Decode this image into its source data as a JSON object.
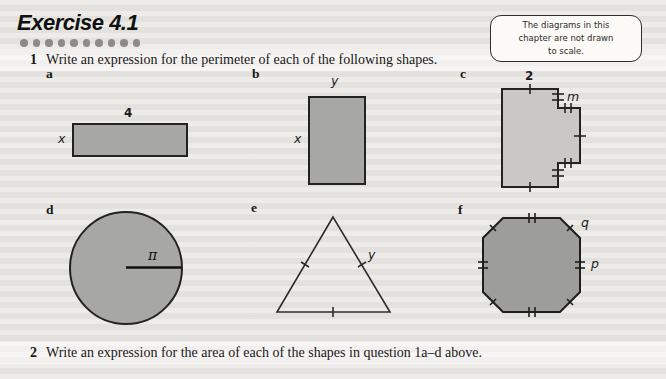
{
  "header": {
    "title": "Exercise 4.1"
  },
  "note_box": {
    "lines": [
      "The diagrams in this",
      "chapter are not drawn",
      "to scale."
    ]
  },
  "questions": [
    {
      "number": "1",
      "text": "Write an expression for the perimeter of each of the following shapes."
    },
    {
      "number": "2",
      "text": "Write an expression for the area of each of the shapes in question 1a–d above."
    }
  ],
  "shapes": {
    "a": {
      "label": "a",
      "type": "wide rectangle",
      "top_label": "4",
      "left_label": "x"
    },
    "b": {
      "label": "b",
      "type": "tall rectangle",
      "top_label": "y",
      "left_label": "x"
    },
    "c": {
      "label": "c",
      "type": "rectilinear polygon with right-hand tab",
      "top_label": "2",
      "tab_label": "m",
      "marks": "single ticks on top, bottom and tab-right edges; double ticks on the four short step edges"
    },
    "d": {
      "label": "d",
      "type": "circle with horizontal radius",
      "radius_label": "π"
    },
    "e": {
      "label": "e",
      "type": "equilateral triangle",
      "side_label": "y",
      "marks": "single tick on each side"
    },
    "f": {
      "label": "f",
      "type": "regular octagon",
      "diagonal_side_label": "q",
      "right_side_label": "p",
      "marks": "double ticks on horizontal and vertical sides, single ticks on diagonal sides"
    }
  },
  "colors": {
    "page_bg": "#e9e7e3",
    "fill_medium": "#a7a7a4",
    "fill_light": "#c9c8c4",
    "fill_dark": "#9d9d9a",
    "outline": "#232323"
  }
}
